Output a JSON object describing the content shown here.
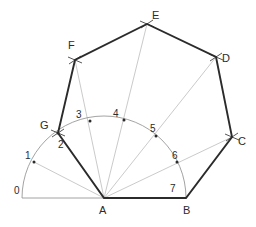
{
  "figure": {
    "background": "#ffffff",
    "colors": {
      "polygon_stroke": "#2b2b2b",
      "construction_stroke": "#b3b3b3",
      "arc_stroke": "#8c8c8c",
      "baseline_stroke": "#8c8c8c",
      "label_text": "#2b2b2b",
      "point_dot": "#2b2b2b"
    },
    "stroke_widths": {
      "polygon": 1.9,
      "construction": 0.7,
      "arc": 0.8,
      "baseline": 0.8
    }
  },
  "geometry": {
    "center_label": "A",
    "center": {
      "x": 104,
      "y": 198
    },
    "radius": 82,
    "baseline": {
      "x1": 22,
      "y1": 198,
      "x2": 186,
      "y2": 198
    },
    "arc": {
      "start_angle_deg": 180,
      "end_angle_deg": 0,
      "divisions": 7
    },
    "arc_points": [
      {
        "label": "0",
        "x": 22,
        "y": 198,
        "dot": false,
        "label_x": 14,
        "label_y": 186
      },
      {
        "label": "1",
        "x": 34,
        "y": 162,
        "dot": true,
        "label_x": 25,
        "label_y": 151
      },
      {
        "label": "2",
        "x": 58,
        "y": 133,
        "dot": true,
        "label_x": 58,
        "label_y": 140
      },
      {
        "label": "3",
        "x": 90,
        "y": 121,
        "dot": true,
        "label_x": 76,
        "label_y": 110
      },
      {
        "label": "4",
        "x": 124,
        "y": 120,
        "dot": true,
        "label_x": 113,
        "label_y": 109
      },
      {
        "label": "5",
        "x": 156,
        "y": 136,
        "dot": true,
        "label_x": 150,
        "label_y": 124
      },
      {
        "label": "6",
        "x": 177,
        "y": 162,
        "dot": true,
        "label_x": 172,
        "label_y": 151
      },
      {
        "label": "7",
        "x": 186,
        "y": 198,
        "dot": false,
        "label_x": 170,
        "label_y": 184
      }
    ],
    "vertices": [
      {
        "label": "A",
        "x": 104,
        "y": 198,
        "label_x": 99,
        "label_y": 205
      },
      {
        "label": "B",
        "x": 186,
        "y": 198,
        "label_x": 183,
        "label_y": 205
      },
      {
        "label": "C",
        "x": 232,
        "y": 137,
        "label_x": 238,
        "label_y": 136
      },
      {
        "label": "D",
        "x": 216,
        "y": 57,
        "label_x": 222,
        "label_y": 53
      },
      {
        "label": "E",
        "x": 147,
        "y": 24,
        "label_x": 152,
        "label_y": 10
      },
      {
        "label": "F",
        "x": 75,
        "y": 60,
        "label_x": 68,
        "label_y": 40
      },
      {
        "label": "G",
        "x": 58,
        "y": 133,
        "label_x": 40,
        "label_y": 120
      }
    ],
    "polygon_path": "A B C D E F G",
    "radial_lines": [
      {
        "from": "A",
        "through": "1",
        "to_x": 34,
        "to_y": 162
      },
      {
        "from": "A",
        "through": "2",
        "to_x": 58,
        "to_y": 133
      },
      {
        "from": "A",
        "through": "3",
        "to_x": 75,
        "to_y": 60
      },
      {
        "from": "A",
        "through": "4",
        "to_x": 147,
        "to_y": 24
      },
      {
        "from": "A",
        "through": "5",
        "to_x": 216,
        "to_y": 57
      },
      {
        "from": "A",
        "through": "6",
        "to_x": 232,
        "to_y": 137
      }
    ],
    "construction_ticks": [
      {
        "at": "F",
        "x": 75,
        "y": 60
      },
      {
        "at": "E",
        "x": 147,
        "y": 24
      },
      {
        "at": "D",
        "x": 216,
        "y": 57
      },
      {
        "at": "C",
        "x": 232,
        "y": 137
      },
      {
        "at": "G",
        "x": 58,
        "y": 133
      }
    ]
  }
}
